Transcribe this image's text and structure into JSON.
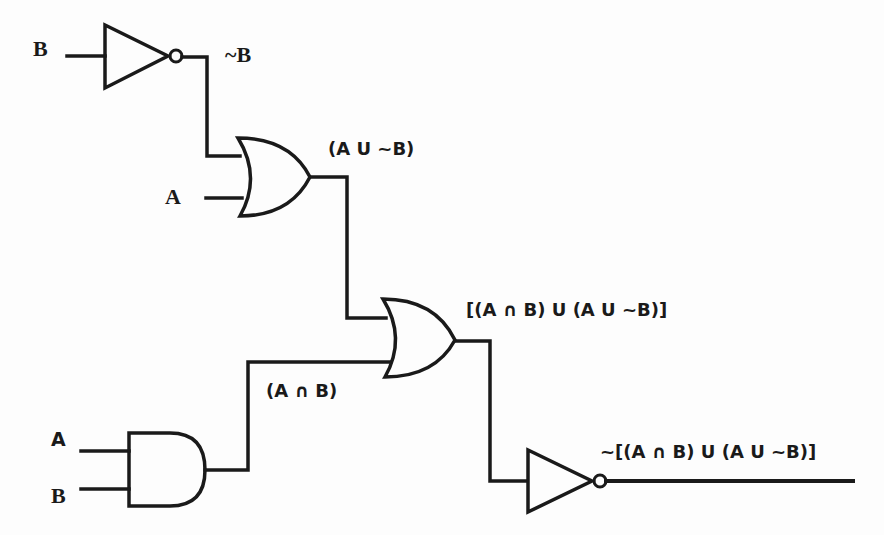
{
  "diagram": {
    "type": "logic-circuit",
    "stroke_color": "#1a1a1a",
    "background": "#fdfdfd",
    "inputs": {
      "not1_input": "B",
      "or1_input_a": "A",
      "and_input_a": "A",
      "and_input_b": "B"
    },
    "labels": {
      "not_b": "~B",
      "a_or_not_b": "(A U ~B)",
      "a_and_b": "(A ∩ B)",
      "or2_output": "[(A ∩ B) U (A U ~B)]",
      "final_output": "~[(A ∩ B) U (A U ~B)]"
    },
    "gates": [
      {
        "id": "not1",
        "type": "NOT",
        "inputs": [
          "B"
        ],
        "output": "~B"
      },
      {
        "id": "or1",
        "type": "OR",
        "inputs": [
          "~B",
          "A"
        ],
        "output": "(A U ~B)"
      },
      {
        "id": "and1",
        "type": "AND",
        "inputs": [
          "A",
          "B"
        ],
        "output": "(A ∩ B)"
      },
      {
        "id": "or2",
        "type": "OR",
        "inputs": [
          "(A U ~B)",
          "(A ∩ B)"
        ],
        "output": "[(A ∩ B) U (A U ~B)]"
      },
      {
        "id": "not2",
        "type": "NOT",
        "inputs": [
          "[(A ∩ B) U (A U ~B)]"
        ],
        "output": "~[(A ∩ B) U (A U ~B)]"
      }
    ]
  }
}
